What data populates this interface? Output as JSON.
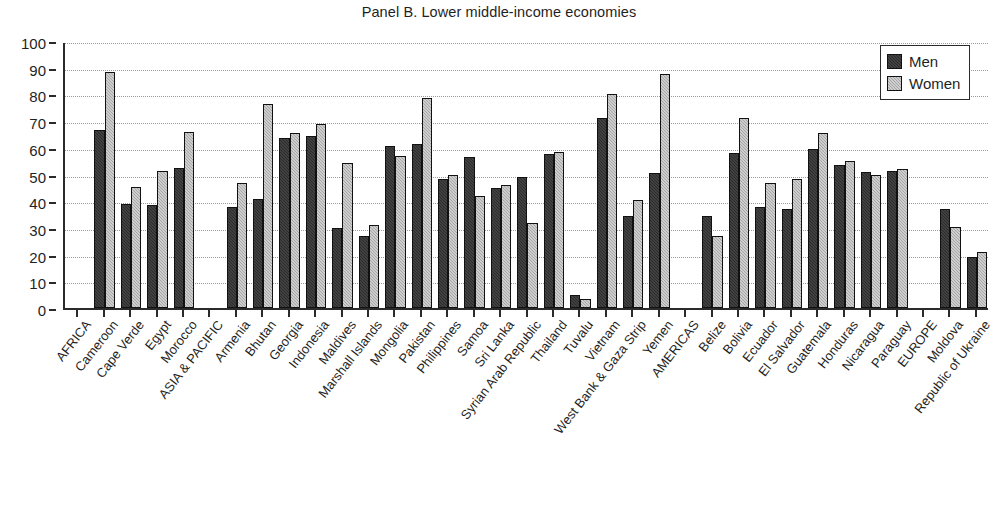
{
  "chart_data": {
    "type": "bar",
    "title": "Panel B. Lower middle-income economies",
    "xlabel": "",
    "ylabel": "",
    "ylim": [
      0,
      100
    ],
    "yticks": [
      0,
      10,
      20,
      30,
      40,
      50,
      60,
      70,
      80,
      90,
      100
    ],
    "grid": true,
    "legend_position": "top-right",
    "colors": {
      "men": "#2b2b2b",
      "women": "#a6a6a6"
    },
    "categories": [
      "AFRICA",
      "Cameroon",
      "Cape Verde",
      "Egypt",
      "Morocco",
      "ASIA & PACIFIC",
      "Armenia",
      "Bhutan",
      "Georgia",
      "Indonesia",
      "Maldives",
      "Marshall Islands",
      "Mongolia",
      "Pakistan",
      "Philippines",
      "Samoa",
      "Sri Lanka",
      "Syrian Arab Republic",
      "Thailand",
      "Tuvalu",
      "Vietnam",
      "West Bank & Gaza Strip",
      "Yemen",
      "AMERICAS",
      "Belize",
      "Bolivia",
      "Ecuador",
      "El Salvador",
      "Guatemala",
      "Honduras",
      "Nicaragua",
      "Paraguay",
      "EUROPE",
      "Moldova",
      "Republic of Ukraine"
    ],
    "series": [
      {
        "name": "Men",
        "values": [
          null,
          66.5,
          39.0,
          38.5,
          52.5,
          null,
          38.0,
          41.0,
          63.5,
          64.5,
          30.0,
          27.0,
          60.5,
          61.5,
          48.5,
          56.5,
          45.0,
          49.0,
          57.5,
          5.0,
          71.0,
          34.5,
          50.5,
          null,
          34.5,
          58.0,
          38.0,
          37.0,
          59.5,
          53.5,
          51.0,
          51.5,
          null,
          37.0,
          19.0
        ]
      },
      {
        "name": "Women",
        "values": [
          null,
          88.5,
          45.5,
          51.5,
          66.0,
          null,
          47.0,
          76.5,
          65.5,
          69.0,
          54.5,
          31.0,
          57.0,
          78.5,
          50.0,
          42.0,
          46.0,
          32.0,
          58.5,
          3.5,
          80.0,
          40.5,
          87.5,
          null,
          27.0,
          71.0,
          47.0,
          48.5,
          65.5,
          55.0,
          50.0,
          52.0,
          null,
          30.5,
          21.0
        ]
      }
    ]
  },
  "legend": {
    "items": [
      {
        "label": "Men",
        "key": "men"
      },
      {
        "label": "Women",
        "key": "women"
      }
    ]
  }
}
